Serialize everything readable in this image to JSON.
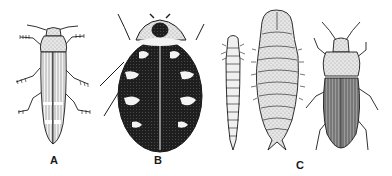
{
  "figure": {
    "labels": {
      "a": "A",
      "b": "B",
      "c": "C"
    },
    "specimens": [
      {
        "id": "a",
        "name": "elongated-striped-beetle"
      },
      {
        "id": "b",
        "name": "carpet-beetle-mottled"
      },
      {
        "id": "c-larva",
        "name": "larva"
      },
      {
        "id": "c-pupa",
        "name": "pupa"
      },
      {
        "id": "c-adult",
        "name": "adult-beetle"
      }
    ],
    "colors": {
      "ink": "#1a1a1a",
      "paper": "#ffffff",
      "light_fill": "#e8e8e8",
      "dark_fill": "#222222"
    }
  }
}
